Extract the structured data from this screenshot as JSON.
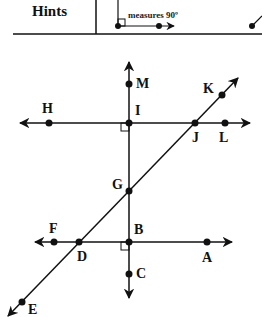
{
  "header": {
    "title": "Hints",
    "hint_caption": "measures 90º"
  },
  "diagram": {
    "points": {
      "M": "M",
      "I": "I",
      "H": "H",
      "K": "K",
      "J": "J",
      "L": "L",
      "G": "G",
      "F": "F",
      "B": "B",
      "D": "D",
      "A": "A",
      "C": "C",
      "E": "E"
    },
    "lines": [
      {
        "name": "line-HL",
        "through": [
          "H",
          "I",
          "J",
          "L"
        ]
      },
      {
        "name": "line-FA",
        "through": [
          "F",
          "D",
          "B",
          "A"
        ]
      },
      {
        "name": "line-MC",
        "through": [
          "M",
          "I",
          "G",
          "B",
          "C"
        ]
      },
      {
        "name": "line-KE",
        "through": [
          "K",
          "J",
          "G",
          "D",
          "E"
        ]
      }
    ],
    "right_angles": [
      "I",
      "B"
    ]
  }
}
